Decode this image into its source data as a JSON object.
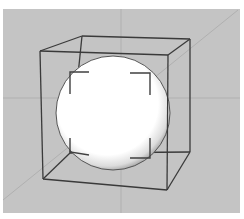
{
  "scene": {
    "canvas": {
      "width": 244,
      "height": 219,
      "page_bg": "#ffffff"
    },
    "viewport": {
      "x": 3,
      "y": 9,
      "width": 237,
      "height": 204,
      "bg": "#c4c4c4"
    },
    "axes": {
      "color": "#b0b0b0",
      "vertical": {
        "x1": 121,
        "y1": 9,
        "x2": 121,
        "y2": 213
      },
      "horizontal": {
        "x1": 3,
        "y1": 98,
        "x2": 240,
        "y2": 98
      },
      "diagonal": {
        "x1": 238,
        "y1": 10,
        "x2": 3,
        "y2": 200
      }
    },
    "sphere": {
      "cx": 113,
      "cy": 113,
      "r": 57,
      "highlight": "#ffffff",
      "shade": "#8a8a8a",
      "outline": "#555555"
    },
    "cube": {
      "stroke": "#3a3a3a",
      "front": {
        "tl": [
          40,
          51
        ],
        "tr": [
          168,
          55
        ],
        "br": [
          167,
          190
        ],
        "bl": [
          43,
          179
        ]
      },
      "back": {
        "tl": [
          82,
          36
        ],
        "tr": [
          190,
          39
        ],
        "br": [
          190,
          152
        ],
        "bl": [
          70,
          153
        ]
      }
    },
    "corner_brackets": {
      "stroke": "#404040",
      "items": [
        {
          "name": "top-left",
          "points": [
            [
              89,
              72
            ],
            [
              70,
              72
            ],
            [
              70,
              94
            ]
          ]
        },
        {
          "name": "top-right",
          "points": [
            [
              130,
              73
            ],
            [
              150,
              73
            ],
            [
              150,
              95
            ]
          ]
        },
        {
          "name": "bottom-right",
          "points": [
            [
              130,
              158
            ],
            [
              150,
              158
            ],
            [
              150,
              138
            ]
          ]
        },
        {
          "name": "bottom-left",
          "points": [
            [
              70,
              138
            ],
            [
              70,
              152
            ],
            [
              89,
              155
            ]
          ]
        }
      ]
    }
  }
}
